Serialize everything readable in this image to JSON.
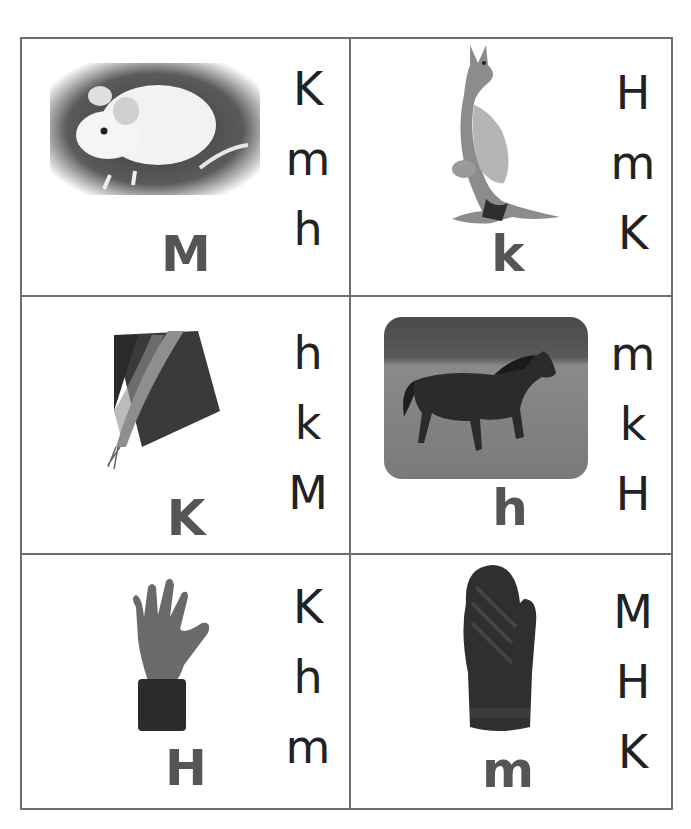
{
  "worksheet": {
    "cards": [
      {
        "picture": "mouse",
        "letter": "M",
        "choices": [
          "K",
          "m",
          "h"
        ]
      },
      {
        "picture": "kangaroo",
        "letter": "k",
        "choices": [
          "H",
          "m",
          "K"
        ]
      },
      {
        "picture": "kite",
        "letter": "K",
        "choices": [
          "h",
          "k",
          "M"
        ]
      },
      {
        "picture": "horse",
        "letter": "h",
        "choices": [
          "m",
          "k",
          "H"
        ]
      },
      {
        "picture": "hand",
        "letter": "H",
        "choices": [
          "K",
          "h",
          "m"
        ]
      },
      {
        "picture": "mitten",
        "letter": "m",
        "choices": [
          "M",
          "H",
          "K"
        ]
      }
    ]
  },
  "colors": {
    "grid_line": "#6e6e6e",
    "big_letter": "#555555",
    "choice_letter": "#222222"
  }
}
